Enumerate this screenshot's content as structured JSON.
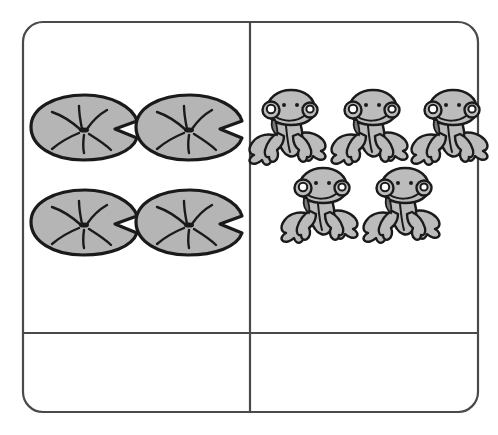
{
  "page": {
    "background_color": "#ffffff",
    "width": 498,
    "height": 435
  },
  "frame": {
    "name": "rounded-rectangle-frame",
    "stroke_color": "#4a4a4a",
    "x": 23,
    "y": 22,
    "width": 455,
    "height": 390,
    "corner_radius": 20,
    "vertical_divider_x": 250,
    "horizontal_divider_y": 333
  },
  "cells": {
    "top_left": {
      "name": "lily-pads-cell",
      "content_label": "lily pads",
      "count": 4,
      "rows": 2,
      "columns": 2
    },
    "top_right": {
      "name": "frogs-cell",
      "content_label": "frogs",
      "count": 5,
      "rows": [
        3,
        2
      ]
    },
    "bottom_left": {
      "name": "answer-cell-left",
      "content_label": "",
      "value": ""
    },
    "bottom_right": {
      "name": "answer-cell-right",
      "content_label": "",
      "value": ""
    }
  },
  "objects": {
    "lily_pad": {
      "icon_name": "lily-pad-icon",
      "fill_color": "#b5b5b5",
      "outline_color": "#1a1a1a"
    },
    "frog": {
      "icon_name": "frog-icon",
      "fill_color": "#bcbcbc",
      "outline_color": "#1a1a1a",
      "eye_color": "#ffffff",
      "throat_color": "#7a7a7a"
    }
  },
  "lily_pads": [
    {
      "id": "lily-pad-1",
      "cx": 85,
      "cy": 127
    },
    {
      "id": "lily-pad-2",
      "cx": 190,
      "cy": 127
    },
    {
      "id": "lily-pad-3",
      "cx": 85,
      "cy": 222
    },
    {
      "id": "lily-pad-4",
      "cx": 190,
      "cy": 222
    }
  ],
  "frogs": [
    {
      "id": "frog-1",
      "cx": 290,
      "cy": 131
    },
    {
      "id": "frog-2",
      "cx": 372,
      "cy": 131
    },
    {
      "id": "frog-3",
      "cx": 452,
      "cy": 131
    },
    {
      "id": "frog-4",
      "cx": 322,
      "cy": 209
    },
    {
      "id": "frog-5",
      "cx": 404,
      "cy": 209
    }
  ]
}
